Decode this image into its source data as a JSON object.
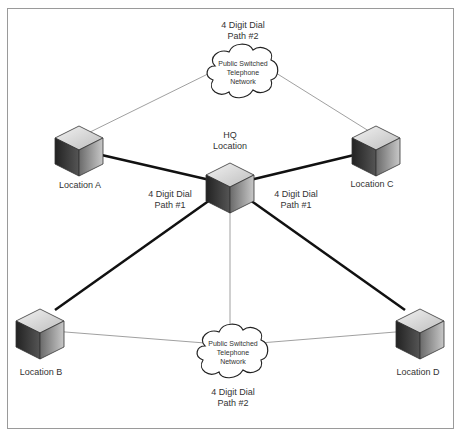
{
  "diagram": {
    "nodes": {
      "hq": {
        "line1": "HQ",
        "line2": "Location"
      },
      "a": {
        "label": "Location A"
      },
      "b": {
        "label": "Location B"
      },
      "c": {
        "label": "Location C"
      },
      "d": {
        "label": "Location D"
      }
    },
    "clouds": {
      "top": {
        "line1": "Public Switched",
        "line2": "Telephone",
        "line3": "Network",
        "path1": "4 Digit Dial",
        "path2": "Path #2"
      },
      "bottom": {
        "line1": "Public Switched",
        "line2": "Telephone",
        "line3": "Network",
        "path1": "4 Digit Dial",
        "path2": "Path #2"
      }
    },
    "path_labels": {
      "left": {
        "line1": "4 Digit Dial",
        "line2": "Path #1"
      },
      "right": {
        "line1": "4 Digit Dial",
        "line2": "Path #1"
      }
    }
  }
}
